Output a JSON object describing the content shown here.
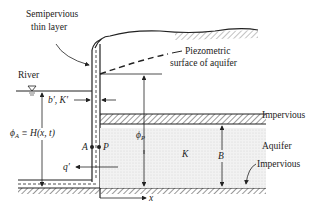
{
  "diagram": {
    "labels": {
      "semipervious_line1": "Semipervious",
      "semipervious_line2": "thin layer",
      "piezo_line1": "Piezometric",
      "piezo_line2": "surface of aquifer",
      "river": "River",
      "bk": "b′, K′",
      "phi_a": "ϕ",
      "phi_a_sub": "A",
      "phi_a_eq": " ≡ H(x, t)",
      "phi_p": "ϕ",
      "phi_p_sub": "P",
      "impervious_top": "Impervious",
      "aquifer": "Aquifer",
      "impervious_bottom": "Impervious",
      "k": "K",
      "b": "B",
      "point_a": "A",
      "point_p": "P",
      "q": "q′",
      "x": "x"
    },
    "colors": {
      "line": "#222222",
      "aquifer_fill": "#ececec",
      "background": "#ffffff"
    }
  }
}
